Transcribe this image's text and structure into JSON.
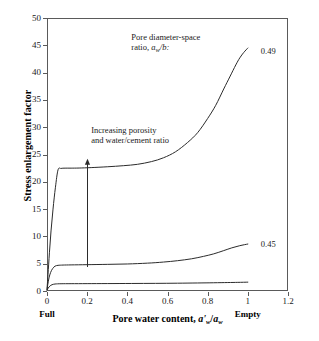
{
  "chart_data": {
    "type": "line",
    "title": "",
    "xlabel": "Pore water content, a'w/aw",
    "xlabel_parts": {
      "lead": "Pore water content, ",
      "num": "a'",
      "num_sub": "w",
      "slash": "/",
      "den": "a",
      "den_sub": "w"
    },
    "ylabel": "Stress enlargement factor",
    "xlim": [
      0,
      1.2
    ],
    "ylim": [
      0,
      50
    ],
    "xticks": [
      "0",
      "0.2",
      "0.4",
      "0.6",
      "0.8",
      "1",
      "1.2"
    ],
    "xtick_values": [
      0,
      0.2,
      0.4,
      0.6,
      0.8,
      1.0,
      1.2
    ],
    "yticks": [
      "0",
      "5",
      "10",
      "15",
      "20",
      "25",
      "30",
      "35",
      "40",
      "45",
      "50"
    ],
    "ytick_values": [
      0,
      5,
      10,
      15,
      20,
      25,
      30,
      35,
      40,
      45,
      50
    ],
    "grid": false,
    "legend_position": "inline-right-of-curve-ends",
    "axis_endpoint_labels": [
      {
        "text": "Full",
        "x": 0.0
      },
      {
        "text": "Empty",
        "x": 1.0
      }
    ],
    "annotations": [
      {
        "name": "pore-diameter-space-ratio-note",
        "line1": "Pore diameter-space",
        "line2_lead": "ratio, ",
        "line2_sym": "a",
        "line2_sub": "w",
        "line2_tail": "/b:",
        "x": 0.42,
        "y": 46.5
      },
      {
        "name": "increasing-porosity-note",
        "line1": "Increasing porosity",
        "line2": "and water/cement ratio",
        "x": 0.22,
        "y": 29.5
      }
    ],
    "arrow": {
      "name": "increasing-porosity-arrow",
      "x": 0.2,
      "y_start": 4.4,
      "y_end": 24.2,
      "direction": "up"
    },
    "series": [
      {
        "name": "0.49",
        "label": "0.49",
        "label_x": 1.04,
        "label_y": 44.0,
        "x": [
          0.0,
          0.005,
          0.012,
          0.02,
          0.03,
          0.042,
          0.055,
          0.07,
          0.09,
          0.12,
          0.16,
          0.22,
          0.3,
          0.38,
          0.45,
          0.52,
          0.58,
          0.64,
          0.7,
          0.75,
          0.8,
          0.84,
          0.88,
          0.91,
          0.94,
          0.96,
          0.98,
          1.0
        ],
        "y": [
          0.3,
          3.0,
          7.0,
          11.0,
          15.0,
          19.0,
          22.2,
          22.45,
          22.5,
          22.5,
          22.52,
          22.6,
          22.75,
          22.95,
          23.2,
          23.7,
          24.4,
          25.5,
          27.2,
          29.0,
          31.6,
          34.0,
          37.0,
          39.2,
          41.4,
          42.7,
          43.7,
          44.5
        ]
      },
      {
        "name": "0.45",
        "label": "0.45",
        "label_x": 1.04,
        "label_y": 8.6,
        "x": [
          0.0,
          0.004,
          0.01,
          0.018,
          0.028,
          0.04,
          0.055,
          0.08,
          0.12,
          0.2,
          0.3,
          0.4,
          0.5,
          0.58,
          0.65,
          0.72,
          0.78,
          0.83,
          0.88,
          0.92,
          0.96,
          1.0
        ],
        "y": [
          0.2,
          1.2,
          2.4,
          3.4,
          4.1,
          4.55,
          4.7,
          4.75,
          4.78,
          4.82,
          4.88,
          4.95,
          5.1,
          5.3,
          5.55,
          5.9,
          6.35,
          6.8,
          7.4,
          7.9,
          8.3,
          8.6
        ]
      },
      {
        "name": "lowest-unlabeled",
        "label": "",
        "x": [
          0.0,
          0.006,
          0.014,
          0.025,
          0.04,
          0.07,
          0.12,
          0.2,
          0.3,
          0.42,
          0.54,
          0.65,
          0.75,
          0.83,
          0.9,
          0.95,
          1.0
        ],
        "y": [
          0.15,
          0.55,
          0.9,
          1.15,
          1.28,
          1.33,
          1.34,
          1.35,
          1.36,
          1.38,
          1.4,
          1.43,
          1.47,
          1.51,
          1.55,
          1.58,
          1.62
        ]
      }
    ]
  }
}
